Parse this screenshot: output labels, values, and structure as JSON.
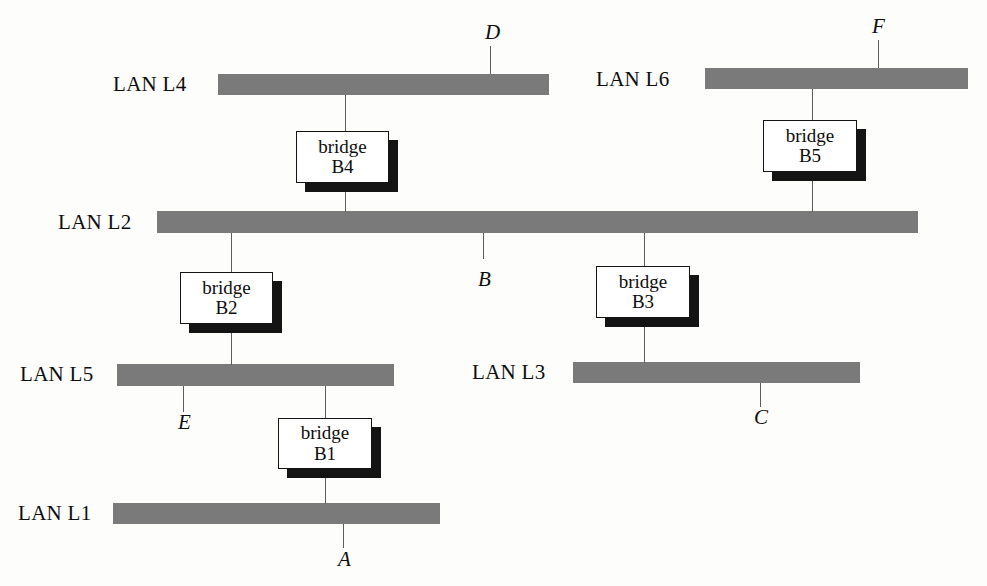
{
  "diagram": {
    "bar_color": "#7a7a7a",
    "wire_color": "#5d5d5d",
    "shadow_color": "#141414",
    "background": "#fdfdfc"
  },
  "lans": [
    {
      "id": "L4",
      "label": "LAN L4",
      "label_x": 113,
      "label_y": 74,
      "bar_x": 218,
      "bar_y": 74,
      "bar_w": 331,
      "bar_h": 21
    },
    {
      "id": "L6",
      "label": "LAN L6",
      "label_x": 596,
      "label_y": 69,
      "bar_x": 705,
      "bar_y": 68,
      "bar_w": 263,
      "bar_h": 21
    },
    {
      "id": "L2",
      "label": "LAN L2",
      "label_x": 58,
      "label_y": 212,
      "bar_x": 157,
      "bar_y": 211,
      "bar_w": 761,
      "bar_h": 22
    },
    {
      "id": "L5",
      "label": "LAN L5",
      "label_x": 20,
      "label_y": 364,
      "bar_x": 117,
      "bar_y": 364,
      "bar_w": 277,
      "bar_h": 22
    },
    {
      "id": "L3",
      "label": "LAN L3",
      "label_x": 472,
      "label_y": 362,
      "bar_x": 573,
      "bar_y": 362,
      "bar_w": 287,
      "bar_h": 21
    },
    {
      "id": "L1",
      "label": "LAN L1",
      "label_x": 18,
      "label_y": 503,
      "bar_x": 113,
      "bar_y": 503,
      "bar_w": 327,
      "bar_h": 21
    }
  ],
  "bridges": [
    {
      "id": "B1",
      "line1": "bridge",
      "line2": "B1",
      "x": 278,
      "y": 418,
      "w": 94,
      "h": 51,
      "connects": [
        "L5",
        "L1"
      ]
    },
    {
      "id": "B2",
      "line1": "bridge",
      "line2": "B2",
      "x": 180,
      "y": 272,
      "w": 93,
      "h": 52,
      "connects": [
        "L2",
        "L5"
      ]
    },
    {
      "id": "B3",
      "line1": "bridge",
      "line2": "B3",
      "x": 596,
      "y": 266,
      "w": 94,
      "h": 52,
      "connects": [
        "L2",
        "L3"
      ]
    },
    {
      "id": "B4",
      "line1": "bridge",
      "line2": "B4",
      "x": 296,
      "y": 131,
      "w": 93,
      "h": 52,
      "connects": [
        "L4",
        "L2"
      ]
    },
    {
      "id": "B5",
      "line1": "bridge",
      "line2": "B5",
      "x": 763,
      "y": 120,
      "w": 94,
      "h": 52,
      "connects": [
        "L6",
        "L2"
      ]
    }
  ],
  "stations": [
    {
      "id": "A",
      "label": "A",
      "label_x": 338,
      "label_y": 549,
      "lan": "L1",
      "wire_x": 343,
      "wire_y": 524,
      "wire_h": 24
    },
    {
      "id": "B",
      "label": "B",
      "label_x": 478,
      "label_y": 269,
      "lan": "L2",
      "wire_x": 483,
      "wire_y": 233,
      "wire_h": 26
    },
    {
      "id": "C",
      "label": "C",
      "label_x": 754,
      "label_y": 407,
      "lan": "L3",
      "wire_x": 760,
      "wire_y": 383,
      "wire_h": 24
    },
    {
      "id": "D",
      "label": "D",
      "label_x": 485,
      "label_y": 22,
      "lan": "L4",
      "wire_x": 490,
      "wire_y": 46,
      "wire_h": 28
    },
    {
      "id": "E",
      "label": "E",
      "label_x": 178,
      "label_y": 412,
      "lan": "L5",
      "wire_x": 183,
      "wire_y": 386,
      "wire_h": 26
    },
    {
      "id": "F",
      "label": "F",
      "label_x": 872,
      "label_y": 16,
      "lan": "L6",
      "wire_x": 878,
      "wire_y": 40,
      "wire_h": 28
    }
  ],
  "bridge_wires": [
    {
      "id": "w-B4-up",
      "from": "L4",
      "to": "B4",
      "x": 345,
      "y": 95,
      "h": 37
    },
    {
      "id": "w-B4-down",
      "from": "B4",
      "to": "L2",
      "x": 345,
      "y": 182,
      "h": 30
    },
    {
      "id": "w-B5-up",
      "from": "L6",
      "to": "B5",
      "x": 812,
      "y": 89,
      "h": 32
    },
    {
      "id": "w-B5-down",
      "from": "B5",
      "to": "L2",
      "x": 812,
      "y": 171,
      "h": 41
    },
    {
      "id": "w-B2-up",
      "from": "L2",
      "to": "B2",
      "x": 231,
      "y": 233,
      "h": 40
    },
    {
      "id": "w-B2-down",
      "from": "B2",
      "to": "L5",
      "x": 231,
      "y": 323,
      "h": 42
    },
    {
      "id": "w-B3-up",
      "from": "L2",
      "to": "B3",
      "x": 644,
      "y": 233,
      "h": 34
    },
    {
      "id": "w-B3-down",
      "from": "B3",
      "to": "L3",
      "x": 644,
      "y": 317,
      "h": 46
    },
    {
      "id": "w-B1-up",
      "from": "L5",
      "to": "B1",
      "x": 325,
      "y": 386,
      "h": 33
    },
    {
      "id": "w-B1-down",
      "from": "B1",
      "to": "L1",
      "x": 325,
      "y": 468,
      "h": 36
    }
  ]
}
